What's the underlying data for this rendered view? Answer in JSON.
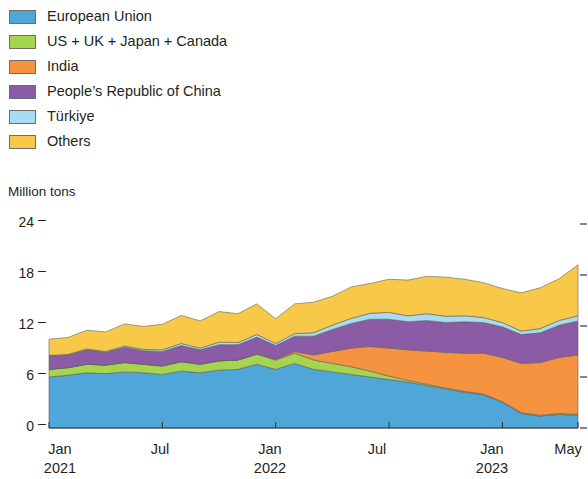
{
  "legend": {
    "items": [
      {
        "label": "European Union",
        "color": "#4EA6D9",
        "key": "eu"
      },
      {
        "label": "US + UK + Japan + Canada",
        "color": "#A5D44F",
        "key": "usukjpca"
      },
      {
        "label": "India",
        "color": "#F69340",
        "key": "india"
      },
      {
        "label": "People’s Republic of China",
        "color": "#8B5BA5",
        "key": "prc"
      },
      {
        "label": "Türkiye",
        "color": "#A9DCF2",
        "key": "turkiye"
      },
      {
        "label": "Others",
        "color": "#F8C948",
        "key": "others"
      }
    ]
  },
  "axes": {
    "y_title": "Million tons",
    "y_ticks": [
      "24",
      "18",
      "12",
      "6",
      "0"
    ],
    "y_tick_dash": "–",
    "x_ticks": [
      {
        "month": "Jan",
        "year": "2021"
      },
      {
        "month": "Jul",
        "year": ""
      },
      {
        "month": "Jan",
        "year": "2022"
      },
      {
        "month": "Jul",
        "year": ""
      },
      {
        "month": "Jan",
        "year": "2023"
      },
      {
        "month": "May",
        "year": ""
      }
    ]
  },
  "chart_data": {
    "type": "area",
    "stacked": true,
    "title": "",
    "xlabel": "",
    "ylabel": "Million tons",
    "ylim": [
      0,
      24
    ],
    "yticks": [
      0,
      6,
      12,
      18,
      24
    ],
    "grid": false,
    "legend_position": "top-left",
    "x": [
      "Jan 2021",
      "Feb 2021",
      "Mar 2021",
      "Apr 2021",
      "May 2021",
      "Jun 2021",
      "Jul 2021",
      "Aug 2021",
      "Sep 2021",
      "Oct 2021",
      "Nov 2021",
      "Dec 2021",
      "Jan 2022",
      "Feb 2022",
      "Mar 2022",
      "Apr 2022",
      "May 2022",
      "Jun 2022",
      "Jul 2022",
      "Aug 2022",
      "Sep 2022",
      "Oct 2022",
      "Nov 2022",
      "Dec 2022",
      "Jan 2023",
      "Feb 2023",
      "Mar 2023",
      "Apr 2023",
      "May 2023"
    ],
    "series": [
      {
        "name": "European Union",
        "color": "#4EA6D9",
        "values": [
          6.0,
          6.2,
          6.5,
          6.4,
          6.6,
          6.5,
          6.3,
          6.7,
          6.5,
          6.8,
          6.9,
          7.5,
          6.9,
          7.6,
          6.9,
          6.6,
          6.3,
          6.0,
          5.7,
          5.4,
          5.0,
          4.6,
          4.2,
          3.9,
          3.0,
          1.7,
          1.4,
          1.6,
          1.5
        ]
      },
      {
        "name": "US + UK + Japan + Canada",
        "color": "#A5D44F",
        "values": [
          0.9,
          0.9,
          1.0,
          1.0,
          1.1,
          1.0,
          1.0,
          1.1,
          1.0,
          1.1,
          1.1,
          1.2,
          1.1,
          1.2,
          1.1,
          1.0,
          0.9,
          0.7,
          0.4,
          0.2,
          0.15,
          0.1,
          0.1,
          0.1,
          0.1,
          0.1,
          0.1,
          0.1,
          0.1
        ]
      },
      {
        "name": "India",
        "color": "#F69340",
        "values": [
          0.0,
          0.0,
          0.0,
          0.0,
          0.0,
          0.0,
          0.0,
          0.0,
          0.0,
          0.0,
          0.0,
          0.0,
          0.1,
          0.2,
          0.6,
          1.4,
          2.2,
          2.9,
          3.3,
          3.6,
          3.9,
          4.2,
          4.5,
          4.8,
          5.2,
          5.8,
          6.2,
          6.6,
          7.0
        ]
      },
      {
        "name": "People’s Republic of China",
        "color": "#8B5BA5",
        "values": [
          1.6,
          1.5,
          1.7,
          1.5,
          1.8,
          1.6,
          1.7,
          1.9,
          1.7,
          1.9,
          1.8,
          2.0,
          1.6,
          1.8,
          2.2,
          2.6,
          2.9,
          3.2,
          3.4,
          3.3,
          3.6,
          3.5,
          3.7,
          3.6,
          3.6,
          3.4,
          3.5,
          3.8,
          4.0
        ]
      },
      {
        "name": "Türkiye",
        "color": "#A9DCF2",
        "values": [
          0.05,
          0.05,
          0.1,
          0.1,
          0.15,
          0.15,
          0.2,
          0.25,
          0.2,
          0.3,
          0.25,
          0.3,
          0.25,
          0.3,
          0.4,
          0.5,
          0.6,
          0.7,
          0.8,
          0.7,
          0.8,
          0.75,
          0.7,
          0.6,
          0.5,
          0.4,
          0.5,
          0.55,
          0.6
        ]
      },
      {
        "name": "Others",
        "color": "#F8C948",
        "values": [
          1.9,
          2.0,
          2.2,
          2.3,
          2.6,
          2.7,
          3.0,
          3.3,
          3.2,
          3.6,
          3.4,
          3.6,
          2.9,
          3.5,
          3.6,
          3.4,
          3.7,
          3.5,
          3.9,
          4.2,
          4.4,
          4.6,
          4.3,
          4.1,
          4.0,
          4.5,
          4.8,
          4.9,
          6.0
        ]
      }
    ]
  }
}
